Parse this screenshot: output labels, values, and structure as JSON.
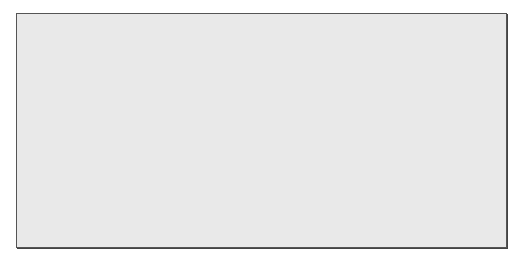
{
  "figure": {
    "top_plot": {
      "signal_label": "s1",
      "signal_subscript": "i",
      "upper_label": "A",
      "lower_label": "−A",
      "start_index_label": "i = 0",
      "end_index_label_prefix": "i = n",
      "end_index_label_sub": "s",
      "end_index_label_suffix": " − 1",
      "waveform": "sine"
    },
    "bottom_plot": {
      "signal_label": "s0",
      "signal_subscript": "i",
      "upper_label": "A",
      "lower_label": "−A",
      "waveform": "negative sine"
    },
    "num_samples": 33,
    "colors": {
      "panel_bg": "#e9e9e9",
      "ink": "#333333",
      "border": "#555555"
    }
  }
}
